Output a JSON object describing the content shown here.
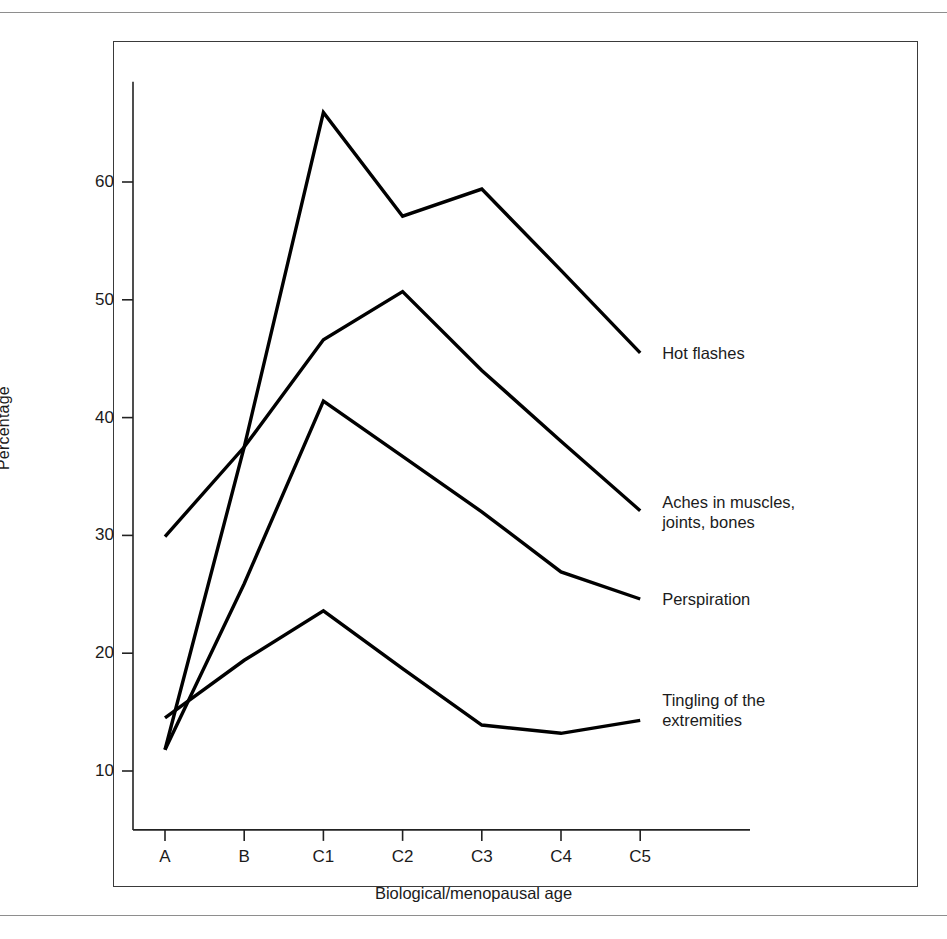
{
  "figure": {
    "border_color": "#3a3a3a",
    "rule_color": "#8e8e8e",
    "line_color": "#000000",
    "background": "#ffffff"
  },
  "chart_data": {
    "type": "line",
    "title": "",
    "subtitle": "",
    "xlabel": "Biological/menopausal age",
    "ylabel": "Percentage",
    "categories": [
      "A",
      "B",
      "C1",
      "C2",
      "C3",
      "C4",
      "C5"
    ],
    "x": [
      0,
      1,
      2,
      3,
      4,
      5,
      6
    ],
    "ylim": [
      5,
      70
    ],
    "yticks": [
      10,
      20,
      30,
      40,
      50,
      60
    ],
    "ytick_labels": [
      "10",
      "20",
      "30",
      "40",
      "50",
      "60"
    ],
    "grid": false,
    "legend_position": "right-of-line-ends",
    "series": [
      {
        "name": "Hot flashes",
        "label": "Hot flashes",
        "values": [
          11.8,
          37.5,
          65.9,
          57.1,
          59.4,
          52.5,
          45.5
        ]
      },
      {
        "name": "Aches in muscles, joints, bones",
        "label": "Aches in muscles,\njoints, bones",
        "values": [
          29.9,
          37.5,
          46.6,
          50.7,
          44.0,
          38.0,
          32.1
        ]
      },
      {
        "name": "Perspiration",
        "label": "Perspiration",
        "values": [
          11.8,
          25.9,
          41.4,
          36.7,
          32.0,
          26.9,
          24.6
        ]
      },
      {
        "name": "Tingling of the extremities",
        "label": "Tingling of the\nextremities",
        "values": [
          14.5,
          19.4,
          23.6,
          18.7,
          13.9,
          13.2,
          14.3
        ]
      }
    ]
  }
}
